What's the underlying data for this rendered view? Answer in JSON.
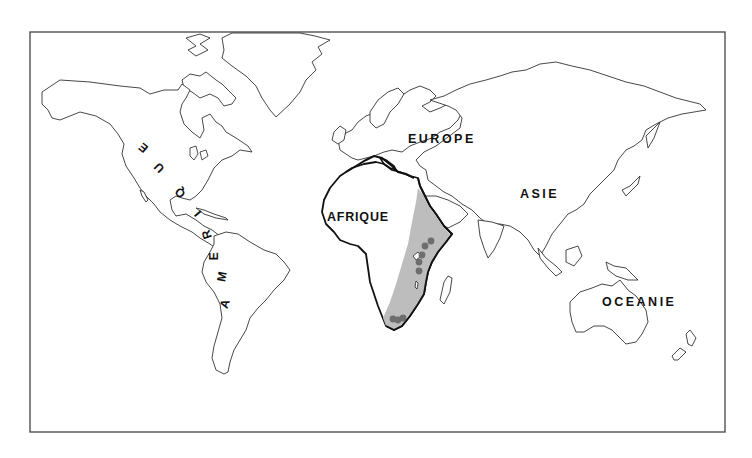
{
  "map": {
    "type": "world outline map",
    "labels": {
      "europe": "EUROPE",
      "asie": "ASIE",
      "afrique": "AFRIQUE",
      "oceanie": "OCEANIE",
      "amerique_letters": [
        "A",
        "M",
        "E",
        "R",
        "I",
        "Q",
        "U",
        "E"
      ]
    },
    "highlight": {
      "region": "Afrique de l'Est et australe",
      "fill_color": "#b9b9b9"
    },
    "sites": {
      "color": "#6e6e6e",
      "count": 8,
      "points": [
        {
          "x": 431,
          "y": 241
        },
        {
          "x": 425,
          "y": 246
        },
        {
          "x": 422,
          "y": 255
        },
        {
          "x": 419,
          "y": 262
        },
        {
          "x": 419,
          "y": 271
        },
        {
          "x": 393,
          "y": 319
        },
        {
          "x": 398,
          "y": 320
        },
        {
          "x": 403,
          "y": 318
        }
      ]
    },
    "colors": {
      "outline": "#333333",
      "africa_outline": "#111111",
      "background": "#ffffff"
    }
  }
}
